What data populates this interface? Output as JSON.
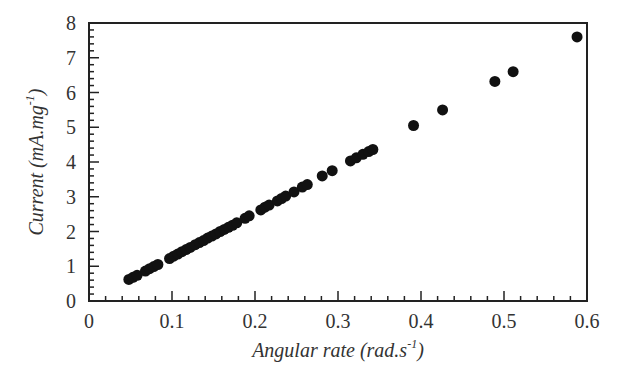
{
  "chart_data": {
    "type": "scatter",
    "title": "",
    "xlabel": "Angular rate (rad.s",
    "xlabel_sup": "-1",
    "xlabel_end": ")",
    "ylabel": "Current (mA.mg",
    "ylabel_sup": "-1",
    "ylabel_end": ")",
    "xlim": [
      0,
      0.6
    ],
    "ylim": [
      0,
      8
    ],
    "xticks": [
      "0",
      "0.1",
      "0.2",
      "0.3",
      "0.4",
      "0.5",
      "0.6"
    ],
    "yticks": [
      "0",
      "1",
      "2",
      "3",
      "4",
      "5",
      "6",
      "7",
      "8"
    ],
    "x_minor_step": 0.02,
    "y_minor_step": 0.2,
    "grid": false,
    "legend": null,
    "marker_color": "#111111",
    "series": [
      {
        "name": "data",
        "points": [
          [
            0.048,
            0.62
          ],
          [
            0.053,
            0.68
          ],
          [
            0.058,
            0.74
          ],
          [
            0.068,
            0.86
          ],
          [
            0.073,
            0.93
          ],
          [
            0.078,
            0.99
          ],
          [
            0.083,
            1.05
          ],
          [
            0.097,
            1.22
          ],
          [
            0.102,
            1.29
          ],
          [
            0.107,
            1.35
          ],
          [
            0.112,
            1.42
          ],
          [
            0.117,
            1.48
          ],
          [
            0.122,
            1.54
          ],
          [
            0.128,
            1.62
          ],
          [
            0.133,
            1.68
          ],
          [
            0.138,
            1.74
          ],
          [
            0.143,
            1.81
          ],
          [
            0.148,
            1.87
          ],
          [
            0.153,
            1.93
          ],
          [
            0.158,
            2.0
          ],
          [
            0.163,
            2.06
          ],
          [
            0.168,
            2.12
          ],
          [
            0.173,
            2.18
          ],
          [
            0.178,
            2.25
          ],
          [
            0.188,
            2.38
          ],
          [
            0.193,
            2.45
          ],
          [
            0.207,
            2.62
          ],
          [
            0.212,
            2.7
          ],
          [
            0.217,
            2.76
          ],
          [
            0.227,
            2.88
          ],
          [
            0.232,
            2.95
          ],
          [
            0.237,
            3.02
          ],
          [
            0.247,
            3.14
          ],
          [
            0.257,
            3.28
          ],
          [
            0.263,
            3.35
          ],
          [
            0.281,
            3.6
          ],
          [
            0.293,
            3.75
          ],
          [
            0.315,
            4.03
          ],
          [
            0.322,
            4.12
          ],
          [
            0.33,
            4.22
          ],
          [
            0.337,
            4.3
          ],
          [
            0.342,
            4.36
          ],
          [
            0.391,
            5.05
          ],
          [
            0.426,
            5.5
          ],
          [
            0.489,
            6.32
          ],
          [
            0.511,
            6.6
          ],
          [
            0.588,
            7.6
          ]
        ]
      }
    ]
  }
}
